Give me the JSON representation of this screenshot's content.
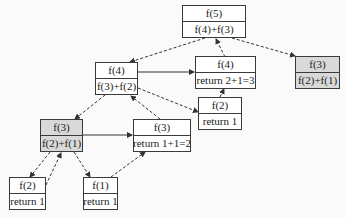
{
  "diagram": {
    "nodes": [
      {
        "id": "n1",
        "title": "f(5)",
        "body": "f(4)+f(3)",
        "shaded": false
      },
      {
        "id": "n2",
        "title": "f(4)",
        "body": "f(3)+f(2)",
        "shaded": false
      },
      {
        "id": "n3",
        "title": "f(4)",
        "body": "return 2+1=3",
        "shaded": false
      },
      {
        "id": "n4",
        "title": "f(3)",
        "body": "f(2)+f(1)",
        "shaded": true
      },
      {
        "id": "n5",
        "title": "f(2)",
        "body": "return 1",
        "shaded": false
      },
      {
        "id": "n6",
        "title": "f(3)",
        "body": "f(2)+f(1)",
        "shaded": true
      },
      {
        "id": "n7",
        "title": "f(3)",
        "body": "return 1+1=2",
        "shaded": false
      },
      {
        "id": "n8",
        "title": "f(2)",
        "body": "return 1",
        "shaded": false
      },
      {
        "id": "n9",
        "title": "f(1)",
        "body": "return 1",
        "shaded": false
      }
    ],
    "edges": [
      {
        "from": "n1",
        "to": "n2",
        "style": "dashed"
      },
      {
        "from": "n1",
        "to": "n4",
        "style": "dashed"
      },
      {
        "from": "n3",
        "to": "n1",
        "style": "dashed"
      },
      {
        "from": "n2",
        "to": "n3",
        "style": "solid"
      },
      {
        "from": "n2",
        "to": "n5",
        "style": "dashed"
      },
      {
        "from": "n5",
        "to": "n3",
        "style": "dashed"
      },
      {
        "from": "n2",
        "to": "n6",
        "style": "dashed"
      },
      {
        "from": "n7",
        "to": "n2",
        "style": "dashed"
      },
      {
        "from": "n6",
        "to": "n7",
        "style": "solid"
      },
      {
        "from": "n6",
        "to": "n8",
        "style": "dashed"
      },
      {
        "from": "n8",
        "to": "n6",
        "style": "dashed"
      },
      {
        "from": "n6",
        "to": "n9",
        "style": "dashed"
      },
      {
        "from": "n9",
        "to": "n7",
        "style": "dashed"
      }
    ],
    "colors": {
      "border": "#3a3a3a",
      "shaded": "#d9d9d9",
      "background": "#fafafa"
    }
  }
}
